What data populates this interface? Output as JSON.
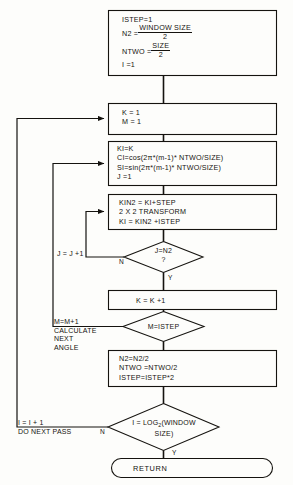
{
  "diagram": {
    "stroke_color": "#15130f",
    "background_color": "#fdfdfb"
  },
  "nodes": {
    "init": {
      "kind": "process",
      "line1": "ISTEP=1",
      "line2_label": "N2 =",
      "line2_num": "WINDOW SIZE",
      "line2_den": "2",
      "line3_label": "NTWO =",
      "line3_num": "SIZE",
      "line3_den": "2",
      "line4": "I =1"
    },
    "k_m_init": {
      "kind": "process",
      "line1": "K = 1",
      "line2": "M = 1"
    },
    "twiddle": {
      "kind": "process",
      "line1": "KI=K",
      "line2": "CI=cos(2π*(m-1)*  NTWO/SIZE)",
      "line3": "SI=sin(2π*(m-1)*  NTWO/SIZE)",
      "line4": "J =1"
    },
    "butterfly": {
      "kind": "process",
      "line1": "KIN2 = KI+STEP",
      "line2": "2 X 2 TRANSFORM",
      "line3": "KI = KIN2 +ISTEP"
    },
    "j_test": {
      "kind": "decision",
      "line1": "J=N2",
      "line2": "?",
      "no_label": "N",
      "yes_label": "Y"
    },
    "k_incr": {
      "kind": "process",
      "line1": "K = K +1"
    },
    "m_test": {
      "kind": "decision",
      "line1": "M=ISTEP"
    },
    "halve": {
      "kind": "process",
      "line1": "N2=N2/2",
      "line2": "NTWO =NTWO/2",
      "line3": "ISTEP=ISTEP*2"
    },
    "pass_test": {
      "kind": "decision",
      "line1": "I = LOG",
      "line1_sub": "2",
      "line1_tail": "(WINDOW",
      "line2": "SIZE)",
      "no_label": "N",
      "yes_label": "Y"
    },
    "return": {
      "kind": "terminator",
      "label": "RETURN"
    }
  },
  "edge_labels": {
    "j_loop": "J = J +1",
    "m_loop_line1": "M=M+1",
    "m_loop_line2": "CALCULATE",
    "m_loop_line3": "NEXT",
    "m_loop_line4": "ANGLE",
    "i_loop_line1": "I = I + 1",
    "i_loop_line2": "DO NEXT PASS"
  }
}
